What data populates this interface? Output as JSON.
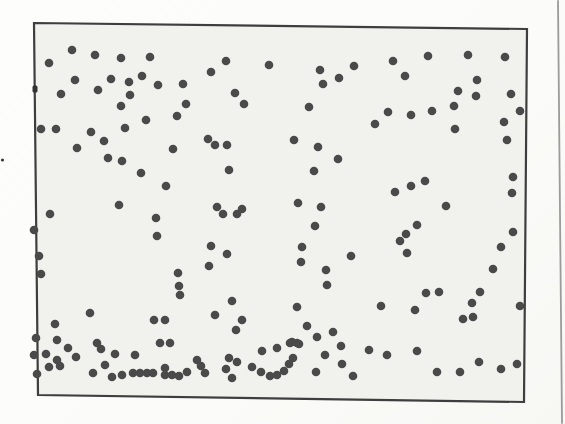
{
  "colors": {
    "page_bg": "#fcfcfa",
    "frame_fill": "#f1f1ee",
    "frame_stroke": "#3e3e3e",
    "dot": "#4a4a4a",
    "page_edge_line": "#9b9b9b",
    "speck": "#3a3a3a",
    "tick": "#333333"
  },
  "chart_data": {
    "type": "scatter",
    "title": "",
    "xlabel": "",
    "ylabel": "",
    "axes_visible": false,
    "gridlines": false,
    "legend": null,
    "frame_corners": [
      [
        34,
        23
      ],
      [
        527,
        29
      ],
      [
        524,
        402
      ],
      [
        38,
        395
      ]
    ],
    "marker": {
      "shape": "circle",
      "radius_px": 4.3
    },
    "point_count": 186,
    "points_px": [
      [
        72,
        50
      ],
      [
        49,
        63
      ],
      [
        95,
        55
      ],
      [
        121,
        58
      ],
      [
        150,
        57
      ],
      [
        75,
        80
      ],
      [
        111,
        79
      ],
      [
        129,
        82
      ],
      [
        142,
        76
      ],
      [
        158,
        85
      ],
      [
        61,
        94
      ],
      [
        98,
        90
      ],
      [
        130,
        95
      ],
      [
        183,
        84
      ],
      [
        186,
        104
      ],
      [
        121,
        106
      ],
      [
        146,
        120
      ],
      [
        177,
        116
      ],
      [
        41,
        129
      ],
      [
        56,
        129
      ],
      [
        91,
        132
      ],
      [
        125,
        128
      ],
      [
        104,
        141
      ],
      [
        77,
        148
      ],
      [
        108,
        158
      ],
      [
        122,
        161
      ],
      [
        141,
        173
      ],
      [
        166,
        186
      ],
      [
        173,
        149
      ],
      [
        50,
        214
      ],
      [
        119,
        205
      ],
      [
        226,
        61
      ],
      [
        211,
        72
      ],
      [
        269,
        65
      ],
      [
        320,
        70
      ],
      [
        354,
        66
      ],
      [
        339,
        78
      ],
      [
        323,
        84
      ],
      [
        235,
        93
      ],
      [
        244,
        104
      ],
      [
        309,
        107
      ],
      [
        208,
        139
      ],
      [
        215,
        145
      ],
      [
        227,
        145
      ],
      [
        229,
        170
      ],
      [
        294,
        140
      ],
      [
        318,
        147
      ],
      [
        338,
        159
      ],
      [
        314,
        171
      ],
      [
        298,
        203
      ],
      [
        217,
        207
      ],
      [
        242,
        209
      ],
      [
        321,
        207
      ],
      [
        393,
        61
      ],
      [
        428,
        56
      ],
      [
        468,
        55
      ],
      [
        505,
        57
      ],
      [
        405,
        76
      ],
      [
        477,
        80
      ],
      [
        458,
        91
      ],
      [
        476,
        96
      ],
      [
        511,
        94
      ],
      [
        454,
        106
      ],
      [
        388,
        112
      ],
      [
        411,
        115
      ],
      [
        432,
        111
      ],
      [
        375,
        124
      ],
      [
        520,
        111
      ],
      [
        504,
        122
      ],
      [
        455,
        129
      ],
      [
        507,
        140
      ],
      [
        513,
        177
      ],
      [
        425,
        181
      ],
      [
        411,
        186
      ],
      [
        395,
        192
      ],
      [
        446,
        206
      ],
      [
        512,
        193
      ],
      [
        156,
        218
      ],
      [
        157,
        236
      ],
      [
        34,
        230
      ],
      [
        39,
        256
      ],
      [
        41,
        274
      ],
      [
        178,
        273
      ],
      [
        179,
        286
      ],
      [
        180,
        295
      ],
      [
        90,
        313
      ],
      [
        55,
        324
      ],
      [
        154,
        320
      ],
      [
        165,
        320
      ],
      [
        36,
        338
      ],
      [
        57,
        340
      ],
      [
        68,
        348
      ],
      [
        97,
        343
      ],
      [
        101,
        349
      ],
      [
        115,
        354
      ],
      [
        135,
        355
      ],
      [
        76,
        357
      ],
      [
        46,
        354
      ],
      [
        34,
        355
      ],
      [
        57,
        360
      ],
      [
        49,
        367
      ],
      [
        60,
        366
      ],
      [
        37,
        374
      ],
      [
        105,
        365
      ],
      [
        93,
        373
      ],
      [
        112,
        377
      ],
      [
        122,
        375
      ],
      [
        133,
        373
      ],
      [
        140,
        373
      ],
      [
        147,
        373
      ],
      [
        153,
        373
      ],
      [
        160,
        343
      ],
      [
        170,
        343
      ],
      [
        165,
        368
      ],
      [
        165,
        375
      ],
      [
        172,
        375
      ],
      [
        179,
        376
      ],
      [
        187,
        372
      ],
      [
        197,
        360
      ],
      [
        201,
        366
      ],
      [
        205,
        373
      ],
      [
        223,
        214
      ],
      [
        237,
        214
      ],
      [
        315,
        226
      ],
      [
        211,
        246
      ],
      [
        227,
        254
      ],
      [
        302,
        247
      ],
      [
        301,
        262
      ],
      [
        209,
        266
      ],
      [
        351,
        256
      ],
      [
        326,
        270
      ],
      [
        327,
        285
      ],
      [
        232,
        301
      ],
      [
        215,
        315
      ],
      [
        297,
        307
      ],
      [
        242,
        320
      ],
      [
        236,
        330
      ],
      [
        307,
        326
      ],
      [
        317,
        337
      ],
      [
        333,
        332
      ],
      [
        292,
        342
      ],
      [
        299,
        344
      ],
      [
        262,
        351
      ],
      [
        277,
        348
      ],
      [
        290,
        343
      ],
      [
        297,
        343
      ],
      [
        229,
        358
      ],
      [
        237,
        362
      ],
      [
        226,
        369
      ],
      [
        252,
        367
      ],
      [
        261,
        372
      ],
      [
        270,
        376
      ],
      [
        277,
        375
      ],
      [
        284,
        371
      ],
      [
        289,
        364
      ],
      [
        293,
        358
      ],
      [
        316,
        372
      ],
      [
        325,
        355
      ],
      [
        342,
        364
      ],
      [
        353,
        376
      ],
      [
        232,
        378
      ],
      [
        341,
        346
      ],
      [
        417,
        225
      ],
      [
        406,
        234
      ],
      [
        400,
        241
      ],
      [
        407,
        253
      ],
      [
        513,
        232
      ],
      [
        501,
        247
      ],
      [
        493,
        269
      ],
      [
        480,
        292
      ],
      [
        426,
        293
      ],
      [
        439,
        292
      ],
      [
        472,
        303
      ],
      [
        381,
        306
      ],
      [
        415,
        310
      ],
      [
        520,
        306
      ],
      [
        463,
        319
      ],
      [
        473,
        317
      ],
      [
        369,
        350
      ],
      [
        387,
        355
      ],
      [
        417,
        351
      ],
      [
        479,
        362
      ],
      [
        437,
        372
      ],
      [
        460,
        372
      ],
      [
        501,
        369
      ],
      [
        517,
        364
      ]
    ]
  },
  "artifacts": {
    "page_edge_line": {
      "x1": 558,
      "y1": 1,
      "x2": 562,
      "y2": 423,
      "width": 1.8
    },
    "margin_speck": {
      "x": 2.5,
      "y": 160,
      "r": 1.6
    },
    "frame_tick": {
      "x": 32.5,
      "y": 85.5,
      "w": 5,
      "h": 7
    }
  }
}
